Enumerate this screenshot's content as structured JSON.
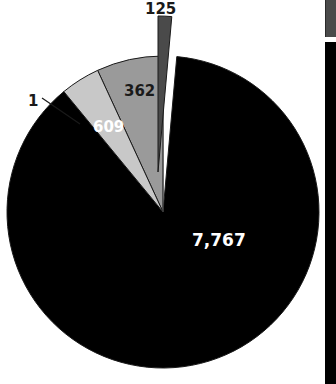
{
  "chart_data": {
    "type": "pie",
    "title": "",
    "subtitle": "",
    "xlabel": "",
    "ylabel": "",
    "legend_position": "right-cropped",
    "grid": false,
    "total": 8864,
    "categories": [
      "7,767",
      "609",
      "362",
      "125",
      "1"
    ],
    "values": [
      7767,
      609,
      362,
      125,
      1
    ],
    "labels": [
      "7,767",
      "609",
      "362",
      "125",
      "1"
    ],
    "slices": [
      {
        "label": "7,767",
        "value": 7767,
        "color": "#000000",
        "label_color": "#ffffff",
        "exploded": false,
        "label_placement": "inside"
      },
      {
        "label": "609",
        "value": 609,
        "color": "#9a9a9a",
        "label_color": "#ffffff",
        "exploded": false,
        "label_placement": "inside"
      },
      {
        "label": "362",
        "value": 362,
        "color": "#c8c8c8",
        "label_color": "#1a1a1a",
        "exploded": false,
        "label_placement": "inside"
      },
      {
        "label": "125",
        "value": 125,
        "color": "#4a4a4a",
        "label_color": "#1a1a1a",
        "exploded": true,
        "label_placement": "outside-top"
      },
      {
        "label": "1",
        "value": 1,
        "color": "#f2f2f2",
        "label_color": "#1a1a1a",
        "exploded": false,
        "label_placement": "outside-leader"
      }
    ],
    "geometry": {
      "center_x": 163,
      "center_y": 212,
      "radius": 156,
      "start_angle_deg": -90
    }
  },
  "labels": {
    "main": "7,767",
    "gray_mid": "609",
    "gray_light": "362",
    "gray_dark": "125",
    "sliver": "1"
  },
  "legend": {
    "swatch_color": "#4a4a4a",
    "bar_color": "#000000"
  },
  "colors": {
    "background": "#ffffff",
    "slice_black": "#000000",
    "slice_gray_mid": "#9a9a9a",
    "slice_gray_light": "#c8c8c8",
    "slice_gray_dark": "#4a4a4a",
    "slice_sliver": "#f2f2f2",
    "outline": "#1a1a1a",
    "leader_line": "#1a1a1a"
  }
}
